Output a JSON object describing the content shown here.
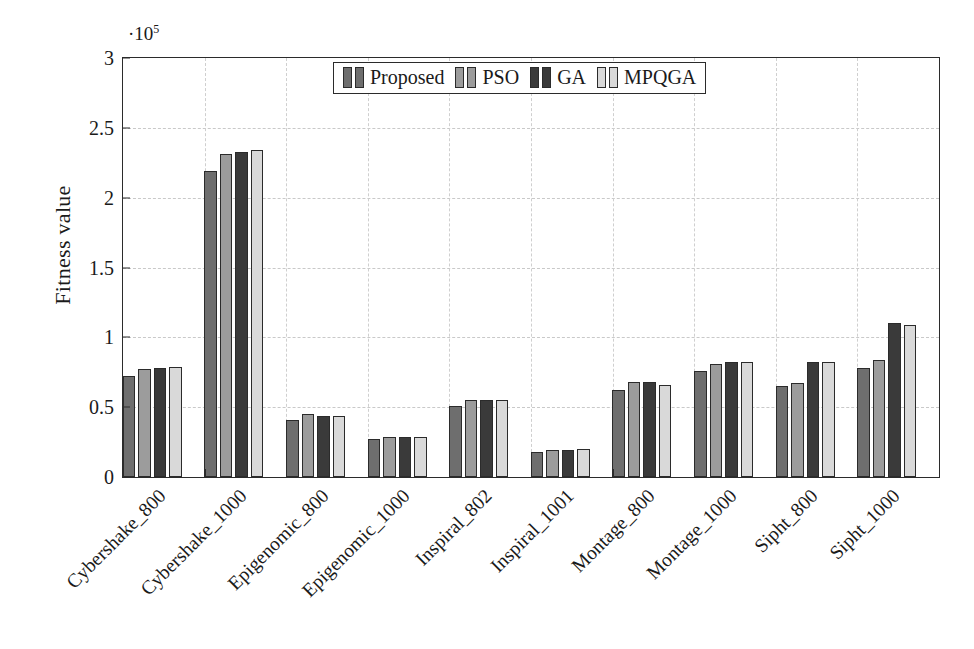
{
  "chart_data": {
    "type": "bar",
    "title": "",
    "xlabel": "",
    "ylabel": "Fitness value",
    "y_exponent_label": "·10⁵",
    "y_exponent_base": "·10",
    "y_exponent_power": "5",
    "ylim": [
      0,
      3
    ],
    "y_scale": 100000,
    "yticks": [
      0,
      0.5,
      1,
      1.5,
      2,
      2.5,
      3
    ],
    "ytick_labels": [
      "0",
      "0.5",
      "1",
      "1.5",
      "2",
      "2.5",
      "3"
    ],
    "grid": true,
    "legend_position": "upper center",
    "categories": [
      "Cybershake_800",
      "Cybershake_1000",
      "Epigenomic_800",
      "Epigenomic_1000",
      "Inspiral_802",
      "Inspiral_1001",
      "Montage_800",
      "Montage_1000",
      "Sipht_800",
      "Sipht_1000"
    ],
    "series": [
      {
        "name": "Proposed",
        "color": "#6e6e6e",
        "values": [
          0.72,
          2.19,
          0.41,
          0.27,
          0.51,
          0.18,
          0.62,
          0.76,
          0.65,
          0.78
        ]
      },
      {
        "name": "PSO",
        "color": "#9c9c9c",
        "values": [
          0.77,
          2.31,
          0.45,
          0.29,
          0.55,
          0.19,
          0.68,
          0.81,
          0.67,
          0.84
        ]
      },
      {
        "name": "GA",
        "color": "#3a3a3a",
        "values": [
          0.78,
          2.33,
          0.44,
          0.29,
          0.55,
          0.19,
          0.68,
          0.82,
          0.82,
          1.1
        ]
      },
      {
        "name": "MPQGA",
        "color": "#d9d9d9",
        "values": [
          0.79,
          2.34,
          0.44,
          0.29,
          0.55,
          0.2,
          0.66,
          0.82,
          0.82,
          1.09
        ]
      }
    ]
  }
}
